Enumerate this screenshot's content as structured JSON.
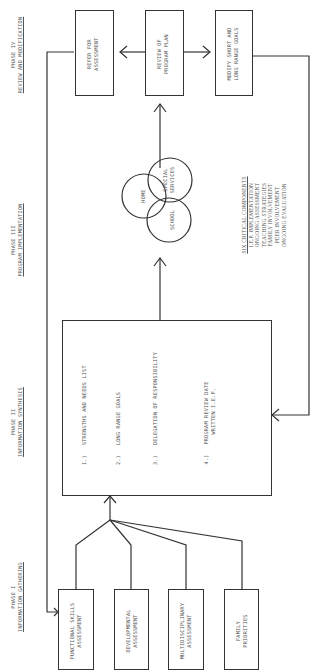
{
  "phases": [
    {
      "label": "PHASE I",
      "title": "INFORMATION GATHERING"
    },
    {
      "label": "PHASE II",
      "title": "INFORMATION SYNTHESIS"
    },
    {
      "label": "PHASE III",
      "title": "PROGRAM IMPLEMENTATION"
    },
    {
      "label": "PHASE IV",
      "title": "REVIEW AND MODIFICATION"
    }
  ],
  "phase1_boxes": [
    {
      "line1": "FUNCTIONAL SKILLS",
      "line2": "ASSESSMENT"
    },
    {
      "line1": "DEVELOPMENTAL",
      "line2": "ASSESSMENT"
    },
    {
      "line1": "MULTIDISCIPLINARY",
      "line2": "ASSESSMENT"
    },
    {
      "line1": "FAMILY",
      "line2": "PRIORITIES"
    }
  ],
  "phase2_list": [
    {
      "num": "1.)",
      "text": "STRENGTHS AND NEEDS LIST"
    },
    {
      "num": "2.)",
      "text": "LONG RANGE GOALS"
    },
    {
      "num": "3.)",
      "text": "DELEGATION OF RESPONSIBILITY"
    },
    {
      "num": "4.)",
      "text": "PROGRAM REVIEW DATE",
      "text2": "WRITTEN I.E.P."
    }
  ],
  "venn": {
    "home": "HOME",
    "school": "SCHOOL",
    "special1": "SPECIAL",
    "special2": "SERVICES"
  },
  "critical_components": {
    "heading": "SIX CRITICAL COMPONENTS",
    "items": [
      "I.E.P. IMPLEMENTATION",
      "ONGOING ASSESSMENT",
      "TEACHING STRATEGIES",
      "FAMILY INVOLVEMENT",
      "PEER INVOLVEMENT",
      "ONGOING EVALUATION"
    ]
  },
  "phase4_boxes": {
    "refer": {
      "line1": "REFER FOR",
      "line2": "ASSESSMENT"
    },
    "review": {
      "line1": "REVIEW OF",
      "line2": "PROGRAM PLAN"
    },
    "modify": {
      "line1": "MODIFY SHORT AND",
      "line2": "LONG RANGE GOALS"
    }
  }
}
